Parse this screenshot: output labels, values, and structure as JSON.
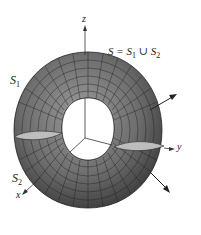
{
  "figure": {
    "title_label": {
      "main": "S = S",
      "sub1": "1",
      "union": " ∪ S",
      "sub2": "2"
    },
    "surface_labels": {
      "s1": "S",
      "s1_sub": "1",
      "s2": "S",
      "s2_sub": "2"
    },
    "axes": {
      "x": "x",
      "y": "y",
      "z": "z"
    },
    "colors": {
      "surface": "#7a7a7a",
      "surface_dark": "#4a4a4a",
      "grid": "#1e1e1e",
      "axis": "#333333",
      "background": "#ffffff"
    }
  }
}
